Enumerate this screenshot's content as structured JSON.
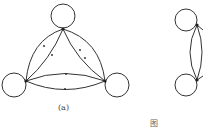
{
  "figure": {
    "panels": [
      {
        "label": "(a)",
        "nodes": [
          {
            "id": "top",
            "x": 63,
            "y": 29,
            "self_loop": true
          },
          {
            "id": "left",
            "x": 26,
            "y": 81,
            "self_loop": true
          },
          {
            "id": "right",
            "x": 105,
            "y": 81,
            "self_loop": true
          }
        ],
        "edges": [
          {
            "from": "top",
            "to": "left",
            "count": 2
          },
          {
            "from": "top",
            "to": "right",
            "count": 2
          },
          {
            "from": "left",
            "to": "right",
            "count": 2
          }
        ]
      },
      {
        "label": "(b)",
        "partially_visible": true,
        "nodes": [
          {
            "id": "upper",
            "x": 197,
            "y": 25,
            "self_loop": true
          },
          {
            "id": "lower",
            "x": 197,
            "y": 80,
            "self_loop": true
          }
        ],
        "edges": [
          {
            "from": "upper",
            "to": "lower",
            "count": 2
          }
        ]
      }
    ],
    "caption": "图"
  },
  "colors": {
    "stroke": "#333333",
    "background": "#ffffff"
  }
}
